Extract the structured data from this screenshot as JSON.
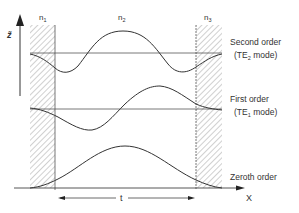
{
  "diagram": {
    "title": "",
    "axis": {
      "vertical_label": "z̃",
      "horizontal_label": "X"
    },
    "regions": [
      {
        "label": "n",
        "subscript": "1",
        "role": "left cladding"
      },
      {
        "label": "n",
        "subscript": "2",
        "role": "core"
      },
      {
        "label": "n",
        "subscript": "3",
        "role": "right cladding"
      }
    ],
    "thickness_label": "t",
    "modes": [
      {
        "name": "Second order",
        "mode": "(TE",
        "mode_sub": "2",
        "mode_tail": " mode)"
      },
      {
        "name": "First order",
        "mode": "(TE",
        "mode_sub": "1",
        "mode_tail": " mode)"
      },
      {
        "name": "Zeroth order",
        "mode": "",
        "mode_sub": "",
        "mode_tail": ""
      }
    ],
    "colors": {
      "line": "#3a3a3a",
      "hatch": "#8a8a8a",
      "background": "#ffffff"
    }
  }
}
